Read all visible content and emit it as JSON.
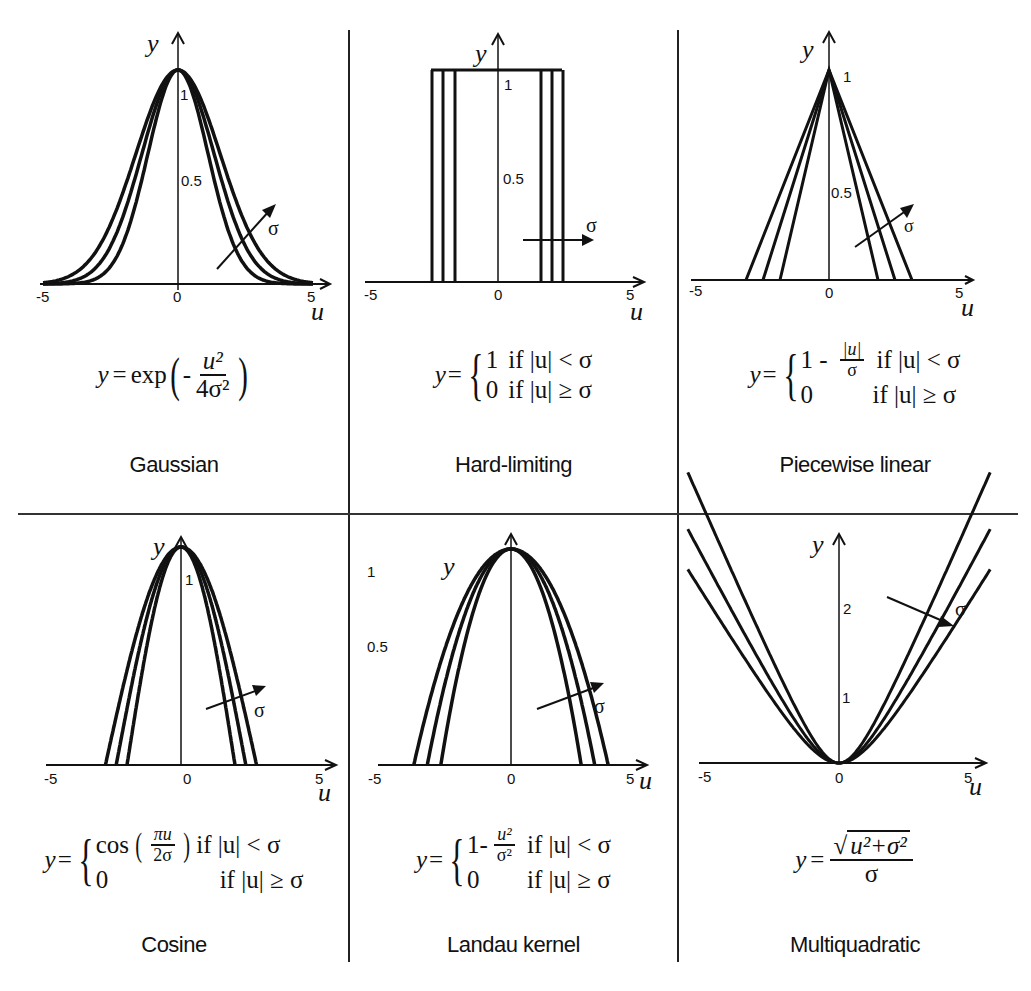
{
  "figure": {
    "panels": [
      {
        "id": "gaussian",
        "name": "Gaussian",
        "formula": {
          "lhs": "y",
          "eq": "=",
          "func": "exp",
          "minus": "-",
          "num": "u²",
          "den": "4σ²"
        },
        "y_axis_label": "y",
        "x_axis_label": "u",
        "x_ticks": [
          "-5",
          "0",
          "5"
        ],
        "y_ticks": [
          "0.5",
          "1"
        ],
        "sigma_label": "σ"
      },
      {
        "id": "hard-limiting",
        "name": "Hard-limiting",
        "formula": {
          "lhs": "y",
          "eq": "=",
          "case1_val": "1",
          "case1_cond": "if |u| < σ",
          "case2_val": "0",
          "case2_cond": "if |u| ≥ σ"
        },
        "y_axis_label": "y",
        "x_axis_label": "u",
        "x_ticks": [
          "-5",
          "0",
          "5"
        ],
        "y_ticks": [
          "0.5",
          "1"
        ],
        "sigma_label": "σ"
      },
      {
        "id": "piecewise-linear",
        "name": "Piecewise linear",
        "formula": {
          "lhs": "y",
          "eq": "=",
          "case1_one": "1 -",
          "case1_num": "|u|",
          "case1_den": "σ",
          "case1_cond": "if |u| < σ",
          "case2_val": "0",
          "case2_cond": "if |u| ≥ σ"
        },
        "y_axis_label": "y",
        "x_axis_label": "u",
        "x_ticks": [
          "-5",
          "0",
          "5"
        ],
        "y_ticks": [
          "0.5",
          "1"
        ],
        "sigma_label": "σ"
      },
      {
        "id": "cosine",
        "name": "Cosine",
        "formula": {
          "lhs": "y",
          "eq": "=",
          "case1_func": "cos",
          "case1_num": "πu",
          "case1_den": "2σ",
          "case1_cond": "if |u| < σ",
          "case2_val": "0",
          "case2_cond": "if |u| ≥ σ"
        },
        "y_axis_label": "y",
        "x_axis_label": "u",
        "x_ticks": [
          "-5",
          "0",
          "5"
        ],
        "y_ticks": [
          "1"
        ],
        "sigma_label": "σ"
      },
      {
        "id": "landau-kernel",
        "name": "Landau kernel",
        "formula": {
          "lhs": "y",
          "eq": "=",
          "case1_one": "1-",
          "case1_num": "u²",
          "case1_den": "σ²",
          "case1_cond": "if |u| < σ",
          "case2_val": "0",
          "case2_cond": "if |u| ≥ σ"
        },
        "y_axis_label": "y",
        "x_axis_label": "u",
        "x_ticks": [
          "-5",
          "0",
          "5"
        ],
        "y_ticks": [
          "0.5",
          "1"
        ],
        "sigma_label": "σ"
      },
      {
        "id": "multiquadratic",
        "name": "Multiquadratic",
        "formula": {
          "lhs": "y",
          "eq": "=",
          "num": "u²+σ²",
          "den": "σ"
        },
        "y_axis_label": "y",
        "x_axis_label": "u",
        "x_ticks": [
          "-5",
          "0",
          "5"
        ],
        "y_ticks": [
          "1",
          "2"
        ],
        "sigma_label": "σ"
      }
    ]
  },
  "chart_data": [
    {
      "type": "line",
      "title": "Gaussian",
      "formula": "y = exp(-u^2 / (4 sigma^2))",
      "xlabel": "u",
      "ylabel": "y",
      "xlim": [
        -5,
        5
      ],
      "ylim": [
        0,
        1
      ],
      "x_ticks": [
        -5,
        0,
        5
      ],
      "y_ticks": [
        0.5,
        1
      ],
      "grid": false,
      "annotation": "arrow labeled σ pointing toward wider curves (increasing σ)",
      "series": [
        {
          "name": "σ = 1.0",
          "x": [
            -5,
            -4,
            -3,
            -2,
            -1,
            0,
            1,
            2,
            3,
            4,
            5
          ],
          "values": [
            0.002,
            0.018,
            0.105,
            0.368,
            0.779,
            1,
            0.779,
            0.368,
            0.105,
            0.018,
            0.002
          ]
        },
        {
          "name": "σ = 1.2",
          "x": [
            -5,
            -4,
            -3,
            -2,
            -1,
            0,
            1,
            2,
            3,
            4,
            5
          ],
          "values": [
            0.013,
            0.062,
            0.209,
            0.499,
            0.841,
            1,
            0.841,
            0.499,
            0.209,
            0.062,
            0.013
          ]
        },
        {
          "name": "σ = 1.4",
          "x": [
            -5,
            -4,
            -3,
            -2,
            -1,
            0,
            1,
            2,
            3,
            4,
            5
          ],
          "values": [
            0.041,
            0.13,
            0.317,
            0.6,
            0.88,
            1,
            0.88,
            0.6,
            0.317,
            0.13,
            0.041
          ]
        }
      ]
    },
    {
      "type": "line",
      "title": "Hard-limiting",
      "formula": "y = 1 if |u| < sigma; 0 if |u| >= sigma",
      "xlabel": "u",
      "ylabel": "y",
      "xlim": [
        -5,
        5
      ],
      "ylim": [
        0,
        1
      ],
      "x_ticks": [
        -5,
        0,
        5
      ],
      "y_ticks": [
        0.5,
        1
      ],
      "grid": false,
      "annotation": "arrow labeled σ pointing right (increasing σ)",
      "series": [
        {
          "name": "σ = 1.5",
          "x": [
            -5,
            -1.5,
            -1.5,
            1.5,
            1.5,
            5
          ],
          "values": [
            0,
            0,
            1,
            1,
            0,
            0
          ]
        },
        {
          "name": "σ = 1.8",
          "x": [
            -5,
            -1.8,
            -1.8,
            1.8,
            1.8,
            5
          ],
          "values": [
            0,
            0,
            1,
            1,
            0,
            0
          ]
        },
        {
          "name": "σ = 2.1",
          "x": [
            -5,
            -2.1,
            -2.1,
            2.1,
            2.1,
            5
          ],
          "values": [
            0,
            0,
            1,
            1,
            0,
            0
          ]
        }
      ]
    },
    {
      "type": "line",
      "title": "Piecewise linear",
      "formula": "y = 1 - |u|/sigma if |u| < sigma; 0 if |u| >= sigma",
      "xlabel": "u",
      "ylabel": "y",
      "xlim": [
        -5,
        5
      ],
      "ylim": [
        0,
        1
      ],
      "x_ticks": [
        -5,
        0,
        5
      ],
      "y_ticks": [
        0.5,
        1
      ],
      "grid": false,
      "annotation": "arrow labeled σ pointing toward wider triangles",
      "series": [
        {
          "name": "σ = 1.8",
          "x": [
            -5,
            -1.8,
            0,
            1.8,
            5
          ],
          "values": [
            0,
            0,
            1,
            0,
            0
          ]
        },
        {
          "name": "σ = 2.3",
          "x": [
            -5,
            -2.3,
            0,
            2.3,
            5
          ],
          "values": [
            0,
            0,
            1,
            0,
            0
          ]
        },
        {
          "name": "σ = 2.8",
          "x": [
            -5,
            -2.8,
            0,
            2.8,
            5
          ],
          "values": [
            0,
            0,
            1,
            0,
            0
          ]
        }
      ]
    },
    {
      "type": "line",
      "title": "Cosine",
      "formula": "y = cos(pi u / (2 sigma)) if |u| < sigma; 0 if |u| >= sigma",
      "xlabel": "u",
      "ylabel": "y",
      "xlim": [
        -5,
        5
      ],
      "ylim": [
        0,
        1
      ],
      "x_ticks": [
        -5,
        0,
        5
      ],
      "y_ticks": [
        1
      ],
      "grid": false,
      "annotation": "arrow labeled σ pointing toward wider curves",
      "series": [
        {
          "name": "σ = 2.0",
          "x": [
            -5,
            -2,
            -1,
            0,
            1,
            2,
            5
          ],
          "values": [
            0,
            0,
            0.707,
            1,
            0.707,
            0,
            0
          ]
        },
        {
          "name": "σ = 2.4",
          "x": [
            -5,
            -2.4,
            -1.2,
            0,
            1.2,
            2.4,
            5
          ],
          "values": [
            0,
            0,
            0.707,
            1,
            0.707,
            0,
            0
          ]
        },
        {
          "name": "σ = 2.8",
          "x": [
            -5,
            -2.8,
            -1.4,
            0,
            1.4,
            2.8,
            5
          ],
          "values": [
            0,
            0,
            0.707,
            1,
            0.707,
            0,
            0
          ]
        }
      ]
    },
    {
      "type": "line",
      "title": "Landau kernel",
      "formula": "y = 1 - u^2/sigma^2 if |u| < sigma; 0 if |u| >= sigma",
      "xlabel": "u",
      "ylabel": "y",
      "xlim": [
        -5,
        5
      ],
      "ylim": [
        0,
        1
      ],
      "x_ticks": [
        -5,
        0,
        5
      ],
      "y_ticks": [
        0.5,
        1
      ],
      "grid": false,
      "annotation": "arrow labeled σ pointing toward wider curves",
      "series": [
        {
          "name": "σ = 2.6",
          "x": [
            -5,
            -2.6,
            -1.3,
            0,
            1.3,
            2.6,
            5
          ],
          "values": [
            0,
            0,
            0.75,
            1,
            0.75,
            0,
            0
          ]
        },
        {
          "name": "σ = 3.1",
          "x": [
            -5,
            -3.1,
            -1.55,
            0,
            1.55,
            3.1,
            5
          ],
          "values": [
            0,
            0,
            0.75,
            1,
            0.75,
            0,
            0
          ]
        },
        {
          "name": "σ = 3.6",
          "x": [
            -5,
            -3.6,
            -1.8,
            0,
            1.8,
            3.6,
            5
          ],
          "values": [
            0,
            0,
            0.75,
            1,
            0.75,
            0,
            0
          ]
        }
      ]
    },
    {
      "type": "line",
      "title": "Multiquadratic",
      "formula": "y = sqrt(u^2 + sigma^2) / sigma",
      "xlabel": "u",
      "ylabel": "y",
      "xlim": [
        -5,
        5
      ],
      "ylim": [
        0,
        3
      ],
      "x_ticks": [
        -5,
        0,
        5
      ],
      "y_ticks": [
        1,
        2
      ],
      "grid": false,
      "annotation": "arrow labeled σ pointing toward flatter curves (increasing σ)",
      "series": [
        {
          "name": "σ = 1.0",
          "x": [
            -4,
            -3,
            -2,
            -1,
            0,
            1,
            2,
            3,
            4
          ],
          "values": [
            4.12,
            3.16,
            2.24,
            1.41,
            1,
            1.41,
            2.24,
            3.16,
            4.12
          ]
        },
        {
          "name": "σ = 1.2",
          "x": [
            -4,
            -3,
            -2,
            -1,
            0,
            1,
            2,
            3,
            4
          ],
          "values": [
            3.48,
            2.69,
            1.94,
            1.3,
            1,
            1.3,
            1.94,
            2.69,
            3.48
          ]
        },
        {
          "name": "σ = 1.4",
          "x": [
            -4,
            -3,
            -2,
            -1,
            0,
            1,
            2,
            3,
            4
          ],
          "values": [
            3.03,
            2.36,
            1.74,
            1.23,
            1,
            1.23,
            1.74,
            2.36,
            3.03
          ]
        }
      ]
    }
  ]
}
